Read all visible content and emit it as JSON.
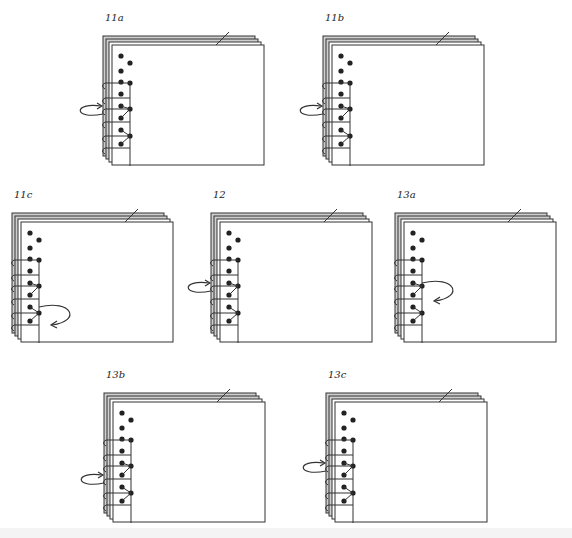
{
  "diagram": {
    "colors": {
      "line": "#333333",
      "dot": "#222222",
      "page_fill": "#ffffff",
      "page_edge_fill": "#cfcfcf"
    },
    "figures": [
      {
        "id": "11a",
        "label": "11a",
        "x": 103,
        "y": 36,
        "arrow": "left-loop-in",
        "arrow_row": 3
      },
      {
        "id": "11b",
        "label": "11b",
        "x": 323,
        "y": 36,
        "arrow": "left-loop-in",
        "arrow_row": 3
      },
      {
        "id": "11c",
        "label": "11c",
        "x": 12,
        "y": 213,
        "arrow": "right-loop-back",
        "arrow_row": 5
      },
      {
        "id": "12",
        "label": "12",
        "x": 211,
        "y": 213,
        "arrow": "left-loop-up",
        "arrow_row": 3
      },
      {
        "id": "13a",
        "label": "13a",
        "x": 395,
        "y": 213,
        "arrow": "right-loop-back",
        "arrow_row": 3
      },
      {
        "id": "13b",
        "label": "13b",
        "x": 104,
        "y": 393,
        "arrow": "left-loop-in",
        "arrow_row": 4
      },
      {
        "id": "13c",
        "label": "13c",
        "x": 326,
        "y": 393,
        "arrow": "left-loop-in",
        "arrow_row": 3
      }
    ]
  }
}
